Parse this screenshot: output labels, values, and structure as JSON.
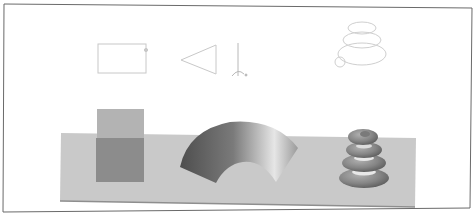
{
  "figure": {
    "colors": {
      "background": "#ffffff",
      "frame": "#6a6a6a",
      "profile_stroke": "#c8c8c8",
      "ground_plane": "#c9c9c9",
      "ground_edge": "#8e8e8e",
      "box_top": "#b3b3b3",
      "box_front": "#8c8c8c",
      "fan_dark": "#5a5a5a",
      "fan_light": "#e0e0e0",
      "torus_stack": "#8a8a8a"
    },
    "profiles": [
      {
        "name": "rectangle-profile",
        "shape": "rectangle"
      },
      {
        "name": "triangle-profile",
        "shape": "triangle"
      },
      {
        "name": "rotation-axis",
        "shape": "vertical axis with rotation arrow"
      },
      {
        "name": "helix-profile",
        "shape": "conical spiral with circle cross-section"
      }
    ],
    "solids": [
      {
        "name": "extruded-box",
        "shape": "box"
      },
      {
        "name": "revolved-fan",
        "shape": "partial revolved surface"
      },
      {
        "name": "helix-sweep",
        "shape": "stacked spiral torus"
      }
    ]
  }
}
